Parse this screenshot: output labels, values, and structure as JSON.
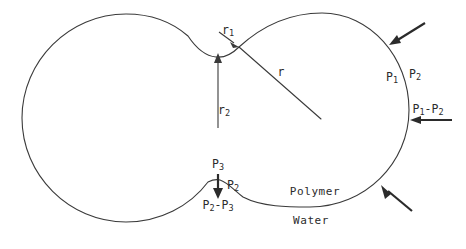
{
  "figure": {
    "type": "schematic-diagram",
    "background_color": "#ffffff",
    "line_color": "#3a3a3a",
    "arrow_color": "#2b2b2b",
    "canvas": {
      "width": 466,
      "height": 249
    }
  },
  "labels": {
    "r1": {
      "base": "r",
      "sub": "1",
      "text": "r1",
      "x": 228,
      "y": 31,
      "meaning": "neck radius at upper cusp"
    },
    "r2": {
      "base": "r",
      "sub": "2",
      "text": "r2",
      "x": 224,
      "y": 111,
      "meaning": "radius of large left lobe"
    },
    "r": {
      "base": "r",
      "sub": "",
      "text": "r",
      "x": 281,
      "y": 73,
      "meaning": "radius of small right lobe"
    },
    "p1": {
      "base": "P",
      "sub": "1",
      "text": "P1",
      "x": 392,
      "y": 78,
      "meaning": "pressure inside polymer lobe"
    },
    "p2": {
      "base": "P",
      "sub": "2",
      "text": "P2",
      "x": 415,
      "y": 75,
      "meaning": "pressure in surrounding water"
    },
    "p1_minus_p2": {
      "text": "P1-P2",
      "x": 428,
      "y": 110,
      "meaning": "Laplace pressure jump across right interface"
    },
    "p3": {
      "base": "P",
      "sub": "3",
      "text": "P3",
      "x": 218,
      "y": 165,
      "meaning": "pressure below lower neck"
    },
    "p2_lower": {
      "base": "P",
      "sub": "2",
      "text": "P2",
      "x": 233,
      "y": 186,
      "meaning": "water pressure at lower neck"
    },
    "p2_minus_p3": {
      "text": "P2-P3",
      "x": 218,
      "y": 206,
      "meaning": "Laplace pressure jump across lower neck"
    },
    "polymer": {
      "text": "Polymer",
      "x": 315,
      "y": 191,
      "meaning": "interior phase label"
    },
    "water": {
      "text": "Water",
      "x": 311,
      "y": 220,
      "meaning": "exterior phase label"
    }
  },
  "geometry": {
    "large_lobe": {
      "cx": 126,
      "cy": 118,
      "rx": 104,
      "ry": 104,
      "note": "large left circle"
    },
    "small_lobe": {
      "cx": 322,
      "cy": 110,
      "rx": 87,
      "ry": 97,
      "note": "smaller right circle"
    },
    "upper_cusp": {
      "x": 239,
      "y": 47
    },
    "lower_neck_peak": {
      "x": 218,
      "y": 180
    },
    "radius_line_r": {
      "x1": 239,
      "y1": 47,
      "x2": 320,
      "y2": 118
    },
    "arrow_r2": {
      "x1": 218,
      "y1": 127,
      "x2": 218,
      "y2": 56
    },
    "arrow_r1": {
      "x1": 220,
      "y1": 33,
      "x2": 237,
      "y2": 46
    }
  },
  "force_arrows": [
    {
      "name": "top-right-inward",
      "x1": 425,
      "y1": 23,
      "x2": 391,
      "y2": 44,
      "direction": "inward"
    },
    {
      "name": "right-inward",
      "x1": 452,
      "y1": 120,
      "x2": 412,
      "y2": 120,
      "direction": "inward-left"
    },
    {
      "name": "bottom-right-inward",
      "x1": 412,
      "y1": 211,
      "x2": 382,
      "y2": 186,
      "direction": "inward"
    },
    {
      "name": "lower-neck-downward",
      "x1": 218,
      "y1": 174,
      "x2": 218,
      "y2": 197,
      "direction": "downward"
    }
  ]
}
